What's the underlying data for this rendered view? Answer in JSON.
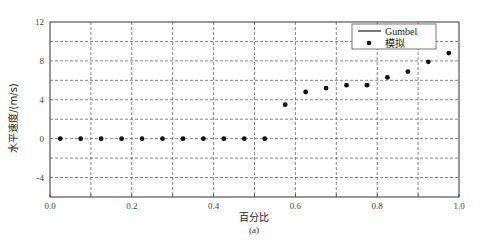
{
  "chart_data": {
    "type": "scatter",
    "title": "",
    "xlabel": "百分比",
    "ylabel": "水平速度/(m/s)",
    "caption": "(a)",
    "xlim": [
      0.0,
      1.0
    ],
    "ylim": [
      -6,
      12
    ],
    "x_ticks": [
      0.0,
      0.2,
      0.4,
      0.6,
      0.8,
      1.0
    ],
    "x_tick_labels": [
      "0.0",
      "0.2",
      "0.4",
      "0.6",
      "0.8",
      "1.0"
    ],
    "y_ticks": [
      -4,
      0,
      4,
      8,
      12
    ],
    "y_tick_labels": [
      "-4",
      "0",
      "4",
      "8",
      "12"
    ],
    "x_grid": [
      0.1,
      0.2,
      0.3,
      0.4,
      0.5,
      0.6,
      0.7,
      0.8,
      0.9
    ],
    "y_grid": [
      -4,
      -2,
      0,
      2,
      4,
      6,
      8,
      10
    ],
    "grid": true,
    "grid_style": "dashed",
    "legend_position": "upper right",
    "legend": [
      {
        "label": "Gumbel",
        "marker": "line"
      },
      {
        "label": "模拟",
        "marker": "dot"
      }
    ],
    "series": [
      {
        "name": "Gumbel",
        "type": "line",
        "x": [],
        "y": []
      },
      {
        "name": "模拟",
        "type": "scatter",
        "x": [
          0.025,
          0.075,
          0.125,
          0.175,
          0.225,
          0.275,
          0.325,
          0.375,
          0.425,
          0.475,
          0.525,
          0.575,
          0.625,
          0.675,
          0.725,
          0.775,
          0.825,
          0.875,
          0.925,
          0.975
        ],
        "y": [
          0,
          0,
          0,
          0,
          0,
          0,
          0,
          0,
          0,
          0,
          0,
          3.5,
          4.8,
          5.2,
          5.5,
          5.5,
          6.3,
          6.9,
          7.9,
          8.8
        ]
      }
    ]
  },
  "colors": {
    "axis": "#333333",
    "grid": "#555555",
    "marker": "#111111"
  }
}
